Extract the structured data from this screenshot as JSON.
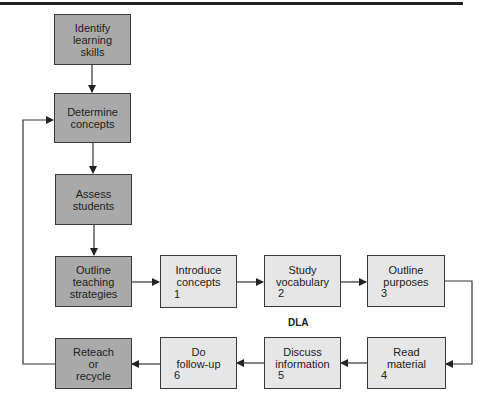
{
  "diagram": {
    "main_flow": [
      {
        "id": "identify",
        "lines": [
          "Identify",
          "learning",
          "skills"
        ]
      },
      {
        "id": "determine",
        "lines": [
          "Determine",
          "concepts"
        ]
      },
      {
        "id": "assess",
        "lines": [
          "Assess",
          "students"
        ]
      },
      {
        "id": "outline-teaching",
        "lines": [
          "Outline",
          "teaching",
          "strategies"
        ]
      },
      {
        "id": "reteach",
        "lines": [
          "Reteach",
          "or",
          "recycle"
        ]
      }
    ],
    "dla_steps": [
      {
        "id": "introduce",
        "lines": [
          "Introduce",
          "concepts"
        ],
        "number": "1"
      },
      {
        "id": "study",
        "lines": [
          "Study",
          "vocabulary"
        ],
        "number": "2"
      },
      {
        "id": "outline-purposes",
        "lines": [
          "Outline",
          "purposes"
        ],
        "number": "3"
      },
      {
        "id": "read",
        "lines": [
          "Read",
          "material"
        ],
        "number": "4"
      },
      {
        "id": "discuss",
        "lines": [
          "Discuss",
          "information"
        ],
        "number": "5"
      },
      {
        "id": "follow-up",
        "lines": [
          "Do",
          "follow-up"
        ],
        "number": "6"
      }
    ],
    "dla_label": "DLA",
    "colors": {
      "dark_box": "#a9a9a9",
      "light_box": "#e6e6e6",
      "line": "#333333"
    }
  }
}
